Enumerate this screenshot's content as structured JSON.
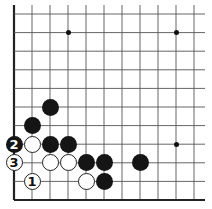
{
  "board": {
    "line_color": "#555555",
    "border_color": "#222222",
    "origin_x": 14,
    "origin_y": 200,
    "spacing_x": 18,
    "spacing_y": 18.6,
    "visible_columns": 11,
    "visible_rows": 11,
    "edges": [
      "left",
      "bottom"
    ]
  },
  "star_points": [
    {
      "col": 3,
      "row": 9
    },
    {
      "col": 9,
      "row": 9
    },
    {
      "col": 9,
      "row": 3
    }
  ],
  "stones": [
    {
      "color": "black",
      "col": 2,
      "row": 5,
      "label": ""
    },
    {
      "color": "black",
      "col": 1,
      "row": 4,
      "label": ""
    },
    {
      "color": "black",
      "col": 0,
      "row": 3,
      "label": "2"
    },
    {
      "color": "white",
      "col": 1,
      "row": 3,
      "label": ""
    },
    {
      "color": "black",
      "col": 2,
      "row": 3,
      "label": ""
    },
    {
      "color": "black",
      "col": 3,
      "row": 3,
      "label": ""
    },
    {
      "color": "white",
      "col": 0,
      "row": 2,
      "label": "3"
    },
    {
      "color": "white",
      "col": 2,
      "row": 2,
      "label": ""
    },
    {
      "color": "white",
      "col": 3,
      "row": 2,
      "label": ""
    },
    {
      "color": "black",
      "col": 4,
      "row": 2,
      "label": ""
    },
    {
      "color": "black",
      "col": 5,
      "row": 2,
      "label": ""
    },
    {
      "color": "black",
      "col": 7,
      "row": 2,
      "label": ""
    },
    {
      "color": "white",
      "col": 1,
      "row": 1,
      "label": "1"
    },
    {
      "color": "white",
      "col": 4,
      "row": 1,
      "label": ""
    },
    {
      "color": "black",
      "col": 5,
      "row": 1,
      "label": ""
    }
  ]
}
